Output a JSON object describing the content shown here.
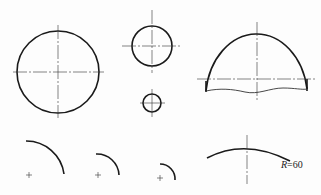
{
  "figures": [
    {
      "id": "large-circle",
      "type": "circle",
      "cx": 58,
      "cy": 72,
      "r": 41
    },
    {
      "id": "medium-circle",
      "type": "circle",
      "cx": 152,
      "cy": 47,
      "r": 20
    },
    {
      "id": "small-circle",
      "type": "circle",
      "cx": 152,
      "cy": 104,
      "r": 9
    },
    {
      "id": "broken-dome",
      "type": "semicircle-broken",
      "cx": 257,
      "cy": 79
    },
    {
      "id": "arc-large",
      "type": "arc"
    },
    {
      "id": "arc-medium",
      "type": "arc"
    },
    {
      "id": "arc-small",
      "type": "arc"
    },
    {
      "id": "arc-r60",
      "type": "arc"
    }
  ],
  "annotation": {
    "radius_label_prefix": "R",
    "radius_label_value": "=60"
  },
  "colors": {
    "line": "#1a1a1a",
    "background": "#fdfdfd"
  }
}
